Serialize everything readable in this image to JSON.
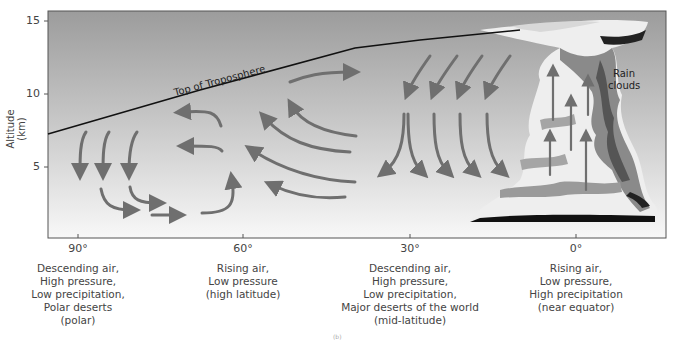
{
  "diagram": {
    "y_axis": {
      "label": "Altitude (km)",
      "ticks": [
        {
          "value": "15",
          "y": 21
        },
        {
          "value": "10",
          "y": 94
        },
        {
          "value": "5",
          "y": 167
        }
      ]
    },
    "x_axis": {
      "ticks": [
        {
          "value": "90°",
          "x": 78
        },
        {
          "value": "60°",
          "x": 243
        },
        {
          "value": "30°",
          "x": 410
        },
        {
          "value": "0°",
          "x": 576
        }
      ]
    },
    "annotations": {
      "tropopause": "Top of Troposphere",
      "rain_clouds_line1": "Rain",
      "rain_clouds_line2": "clouds"
    },
    "zones": [
      {
        "latitude": "90°",
        "description": "Descending air,\nHigh pressure,\nLow precipitation,\nPolar deserts\n(polar)"
      },
      {
        "latitude": "60°",
        "description": "Rising air,\nLow pressure\n(high latitude)"
      },
      {
        "latitude": "30°",
        "description": "Descending air,\nHigh pressure,\nLow precipitation,\nMajor deserts of the world\n(mid-latitude)"
      },
      {
        "latitude": "0°",
        "description": "Rising air,\nLow pressure,\nHigh precipitation\n(near equator)"
      }
    ],
    "panel_tag": "(b)",
    "colors": {
      "sky_top": "#9e9e9e",
      "sky_bottom": "#f7f7f7",
      "arrow": "#6f6f6f",
      "tropopause_line": "#111111",
      "frame": "#555555"
    }
  }
}
